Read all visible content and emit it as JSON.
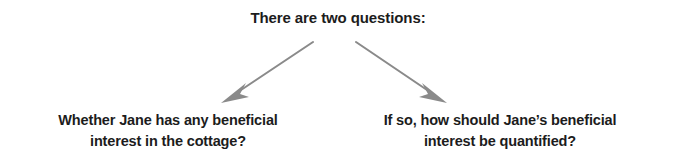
{
  "diagram": {
    "type": "flow-tree",
    "background_color": "#ffffff",
    "text_color": "#1c1c1c",
    "arrow_color": "#8a8a8a",
    "title": {
      "text": "There are two questions:"
    },
    "branches": [
      {
        "id": "left",
        "arrow_name": "arrow-to-question-left",
        "lines": [
          "Whether Jane has any beneficial",
          "interest in the cottage?"
        ]
      },
      {
        "id": "right",
        "arrow_name": "arrow-to-question-right",
        "lines": [
          "If so, how should Jane’s beneficial",
          "interest be quantified?"
        ]
      }
    ]
  }
}
